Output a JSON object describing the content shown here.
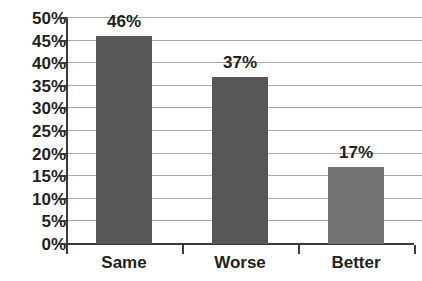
{
  "chart_data": {
    "type": "bar",
    "title": "",
    "xlabel": "",
    "ylabel": "",
    "categories": [
      "Same",
      "Worse",
      "Better"
    ],
    "values": [
      46,
      37,
      17
    ],
    "value_labels": [
      "46%",
      "37%",
      "17%"
    ],
    "ylim": [
      0,
      50
    ],
    "ytick_values": [
      0,
      5,
      10,
      15,
      20,
      25,
      30,
      35,
      40,
      45,
      50
    ],
    "ytick_labels": [
      "0%",
      "5%",
      "10%",
      "15%",
      "20%",
      "25%",
      "30%",
      "35%",
      "40%",
      "45%",
      "50%"
    ],
    "grid": true,
    "legend": "none",
    "bar_colors": [
      "#575757",
      "#575757",
      "#737373"
    ],
    "gridline_color": "#a9a9a9",
    "axis_color": "#3a3a3a",
    "label_color": "#231f20",
    "background_color": "#ffffff"
  }
}
